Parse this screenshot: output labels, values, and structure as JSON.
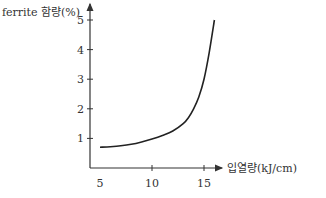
{
  "chart_data": {
    "type": "line",
    "title": "",
    "xlabel": "입열량(kJ/cm)",
    "ylabel": "ferrite 함량(%)",
    "x_ticks": [
      5,
      10,
      15
    ],
    "y_ticks": [
      1,
      2,
      3,
      4,
      5
    ],
    "xlim": [
      4,
      19
    ],
    "ylim": [
      0,
      5.2
    ],
    "grid": false,
    "legend": null,
    "series": [
      {
        "name": "ferrite content",
        "x": [
          5,
          6,
          7,
          8,
          9,
          10,
          11,
          12,
          13,
          13.5,
          14,
          14.5,
          15,
          15.5,
          16
        ],
        "y": [
          0.7,
          0.72,
          0.75,
          0.8,
          0.88,
          0.98,
          1.1,
          1.25,
          1.5,
          1.7,
          2.0,
          2.4,
          3.0,
          3.9,
          5.0
        ]
      }
    ]
  }
}
